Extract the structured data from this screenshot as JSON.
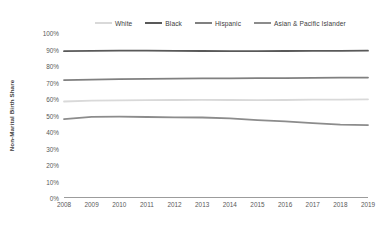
{
  "chart_data": {
    "type": "line",
    "title": "",
    "xlabel": "",
    "ylabel": "Non-Marital Birth Share",
    "x": [
      2008,
      2009,
      2010,
      2011,
      2012,
      2013,
      2014,
      2015,
      2016,
      2017,
      2018,
      2019
    ],
    "xtick_labels": [
      "2008",
      "2009",
      "2010",
      "2011",
      "2012",
      "2013",
      "2014",
      "2015",
      "2016",
      "2017",
      "2018",
      "2019"
    ],
    "ytick_labels": [
      "0%",
      "10%",
      "20%",
      "30%",
      "40%",
      "50%",
      "60%",
      "70%",
      "80%",
      "90%",
      "100%"
    ],
    "ytick_values": [
      0,
      10,
      20,
      30,
      40,
      50,
      60,
      70,
      80,
      90,
      100
    ],
    "ylim": [
      0,
      100
    ],
    "grid": false,
    "legend_position": "top",
    "series": [
      {
        "name": "White",
        "color": "#d9d9d9",
        "values": [
          58.5,
          59.0,
          59.2,
          59.3,
          59.4,
          59.5,
          59.4,
          59.3,
          59.4,
          59.6,
          59.6,
          59.8
        ]
      },
      {
        "name": "Black",
        "color": "#595959",
        "values": [
          89.0,
          89.2,
          89.3,
          89.3,
          89.2,
          89.1,
          89.0,
          89.0,
          89.1,
          89.2,
          89.2,
          89.3
        ]
      },
      {
        "name": "Hispanic",
        "color": "#808080",
        "values": [
          71.5,
          71.8,
          72.0,
          72.2,
          72.4,
          72.5,
          72.5,
          72.6,
          72.7,
          72.8,
          72.9,
          73.0
        ]
      },
      {
        "name": "Asian & Pacific Islander",
        "color": "#8c8c8c",
        "values": [
          47.8,
          49.2,
          49.3,
          49.1,
          48.9,
          48.8,
          48.2,
          47.2,
          46.4,
          45.4,
          44.5,
          44.2
        ]
      }
    ]
  }
}
